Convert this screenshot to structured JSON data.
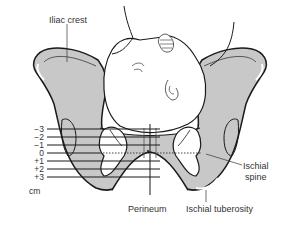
{
  "figure": {
    "labels": {
      "iliac_crest": "Iliac crest",
      "ischial_spine_line1": "Ischial",
      "ischial_spine_line2": "spine",
      "perineum": "Perineum",
      "ischial_tuberosity": "Ischial tuberosity",
      "unit": "cm"
    },
    "stations": [
      "−3",
      "−2",
      "−1",
      "0",
      "+1",
      "+2",
      "+3"
    ],
    "colors": {
      "bone_fill": "#c8c8c8",
      "outline": "#1a1a1a",
      "text": "#333333",
      "background": "#ffffff"
    }
  }
}
